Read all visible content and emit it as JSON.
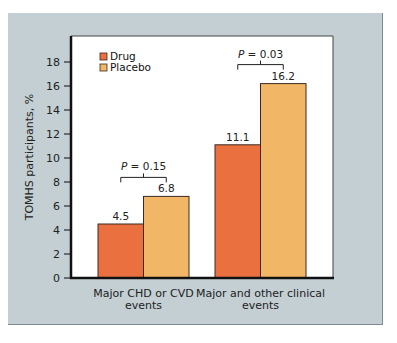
{
  "chart_data": {
    "type": "bar",
    "title": "",
    "xlabel": "",
    "ylabel": "TOMHS participants, %",
    "ylim": [
      0,
      19
    ],
    "yticks": [
      0,
      2,
      4,
      6,
      8,
      10,
      12,
      14,
      16,
      18
    ],
    "grid": false,
    "legend_position": "top-left",
    "categories": [
      "Major CHD or CVD events",
      "Major and other clinical events"
    ],
    "category_lines": [
      [
        "Major CHD or CVD",
        "events"
      ],
      [
        "Major and other clinical",
        "events"
      ]
    ],
    "series": [
      {
        "name": "Drug",
        "color": "#ea7040",
        "values": [
          4.5,
          11.1
        ]
      },
      {
        "name": "Placebo",
        "color": "#f2b766",
        "values": [
          6.8,
          16.2
        ]
      }
    ],
    "annotations": [
      {
        "category": 0,
        "text": "P = 0.15",
        "p_value": 0.15
      },
      {
        "category": 1,
        "text": "P = 0.03",
        "p_value": 0.03
      }
    ]
  },
  "colors": {
    "frame_background": "#c3cfd3",
    "plot_background": "#ffffff",
    "axis": "#111111"
  }
}
